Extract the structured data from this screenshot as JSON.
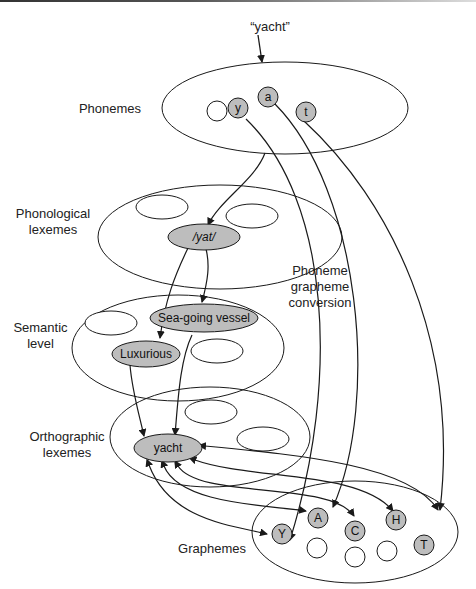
{
  "diagram": {
    "input_word": "“yacht”",
    "levels": [
      {
        "id": "phonemes",
        "label_line1": "Phonemes",
        "label_line2": ""
      },
      {
        "id": "phonological-lexemes",
        "label_line1": "Phonological",
        "label_line2": "lexemes"
      },
      {
        "id": "semantic-level",
        "label_line1": "Semantic",
        "label_line2": "level"
      },
      {
        "id": "orthographic-lexemes",
        "label_line1": "Orthographic",
        "label_line2": "lexemes"
      },
      {
        "id": "graphemes",
        "label_line1": "Graphemes",
        "label_line2": ""
      }
    ],
    "route_label": {
      "line1": "Phoneme",
      "line2": "grapheme",
      "line3": "conversion"
    },
    "nodes": {
      "phonemes": [
        "y",
        "a",
        "t"
      ],
      "phonological": "/yat/",
      "semantic": [
        "Sea-going vessel",
        "Luxurious"
      ],
      "orthographic": "yacht",
      "graphemes": [
        "Y",
        "A",
        "C",
        "H",
        "T"
      ]
    },
    "colors": {
      "stroke": "#1a1a1a",
      "active_fill": "#bdbdbd",
      "inactive_fill": "#ffffff"
    }
  }
}
